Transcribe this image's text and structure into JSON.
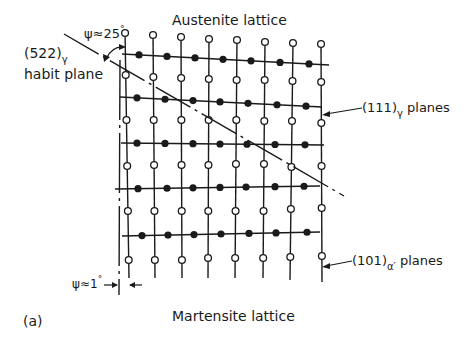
{
  "figure": {
    "panel_label": "(a)",
    "top_title": "Austenite lattice",
    "bottom_title": "Martensite lattice"
  },
  "labels": {
    "habit_plane": {
      "indices": "(522)",
      "subscript": "γ",
      "text": "habit plane"
    },
    "psi_large": {
      "symbol": "ψ",
      "relation": "≈",
      "value": "25",
      "unit": "°"
    },
    "psi_small": {
      "symbol": "ψ",
      "relation": "≈",
      "value": "1",
      "unit": "°"
    },
    "austenite_planes": {
      "indices": "(111)",
      "subscript": "γ",
      "text": "planes"
    },
    "martensite_planes": {
      "indices": "(101)",
      "subscript": "α′",
      "text": "planes"
    }
  },
  "lattice": {
    "vertical_lines": 8,
    "horizontal_lines": 5,
    "open_circle_rows": 6,
    "filled_circle_rows": 5,
    "open_circle_meaning": "martensite (101)α′ plane atoms",
    "filled_circle_meaning": "austenite (111)γ plane atoms"
  },
  "colors": {
    "ink": "#1a1a1a",
    "background": "#ffffff"
  }
}
